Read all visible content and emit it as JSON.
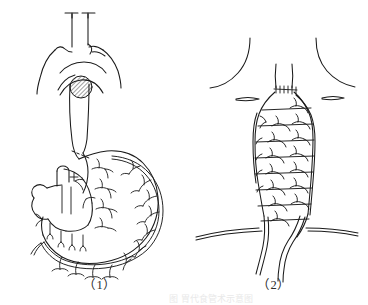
{
  "document": {
    "type": "medical-line-illustration",
    "background_color": "#ffffff",
    "ink_color": "#1a1a1a",
    "width": 368,
    "height": 301
  },
  "figures": [
    {
      "id": "figure-1",
      "caption": "（1）",
      "subject": "stomach-and-esophagus-with-vascular-arcade",
      "parts": [
        {
          "name": "esophagus-upper-segment",
          "description": "vertical double-line tube at top with transverse cut marks"
        },
        {
          "name": "diaphragm-outline",
          "description": "wing-shaped curve below the esophageal hiatus"
        },
        {
          "name": "hatched-hiatus-marker",
          "description": "diagonally hatched circular disc at the esophageal hiatus",
          "fill": "diagonal-hatch"
        },
        {
          "name": "esophagus-lower-segment",
          "description": "descending tube joining the gastric cardia"
        },
        {
          "name": "stomach-body",
          "description": "large curved gastric silhouette"
        },
        {
          "name": "duodenum",
          "description": "small loop at the lower left of the stomach"
        },
        {
          "name": "greater-curvature-arcade",
          "description": "gastroepiploic vascular arcade running along the greater curvature"
        },
        {
          "name": "lesser-curvature-vessels",
          "description": "short branching vessels along the lesser curvature"
        },
        {
          "name": "omental-branches",
          "description": "downward branching omental vessels"
        },
        {
          "name": "resection-dashed-line",
          "description": "short dashed line at the gastric cardia indicating the division level"
        }
      ]
    },
    {
      "id": "figure-2",
      "caption": "（2）",
      "subject": "cervical-gastric-conduit-reconstruction",
      "parts": [
        {
          "name": "neck-contour-left",
          "description": "left sternocleidomastoid / shoulder contour line"
        },
        {
          "name": "neck-contour-right",
          "description": "right sternocleidomastoid / shoulder contour line"
        },
        {
          "name": "clavicle-left",
          "description": "short flattened oval representing left clavicle"
        },
        {
          "name": "clavicle-right",
          "description": "short flattened oval representing right clavicle"
        },
        {
          "name": "cervical-esophagus-stump",
          "description": "narrow double-line tube descending from the neck"
        },
        {
          "name": "anastomosis-suture-line",
          "description": "row of short cross-hatch stitches at the esophagogastric anastomosis"
        },
        {
          "name": "gastric-tube-conduit",
          "description": "elongated tubularized gastric conduit with ladder-like transverse vessels"
        },
        {
          "name": "transverse-vessel-rungs",
          "description": "ladder rungs of branching arrow-like vessels across the conduit"
        },
        {
          "name": "diaphragm-line",
          "description": "long horizontal double line crossing the lower conduit"
        },
        {
          "name": "pedicle-vessels",
          "description": "two descending vessel strands below the diaphragm"
        }
      ]
    }
  ],
  "footer": {
    "text": "图 胃代食管术示意图"
  }
}
